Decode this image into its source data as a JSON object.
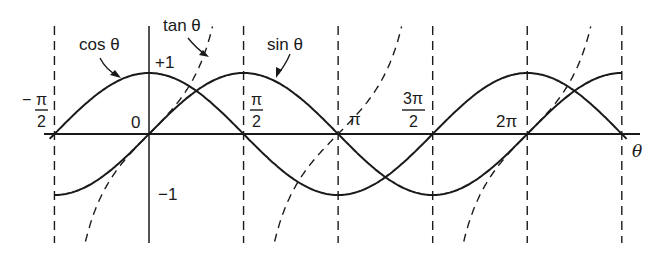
{
  "chart_data": {
    "type": "line",
    "title": "",
    "xlabel": "θ",
    "ylabel": "",
    "xlim": [
      -1.5708,
      7.854
    ],
    "ylim": [
      -1.6,
      1.6
    ],
    "grid": false,
    "legend": "inline annotations with arrows",
    "x_tick_labels": [
      "-π/2",
      "0",
      "π/2",
      "π",
      "3π/2",
      "2π"
    ],
    "y_tick_labels": [
      "+1",
      "-1"
    ],
    "vertical_dashed_asymptotes": [
      "-π/2",
      "π/2",
      "3π/2",
      "5π/2"
    ],
    "vertical_dashed_guides": [
      "π/2",
      "π",
      "3π/2",
      "2π",
      "5π/2"
    ],
    "series": [
      {
        "name": "cos θ",
        "style": "solid",
        "domain": [
          "-π/2",
          "5π/2"
        ],
        "x": [
          "-π/2",
          "0",
          "π/2",
          "π",
          "3π/2",
          "2π",
          "5π/2"
        ],
        "values": [
          0,
          1,
          0,
          -1,
          0,
          1,
          0
        ]
      },
      {
        "name": "sin θ",
        "style": "solid",
        "domain": [
          "-π/2",
          "5π/2"
        ],
        "x": [
          "-π/2",
          "0",
          "π/2",
          "π",
          "3π/2",
          "2π",
          "5π/2"
        ],
        "values": [
          -1,
          0,
          1,
          0,
          -1,
          0,
          1
        ]
      },
      {
        "name": "tan θ",
        "style": "dashed",
        "branches": [
          [
            "-π/2",
            "π/2"
          ],
          [
            "π/2",
            "3π/2"
          ],
          [
            "3π/2",
            "5π/2"
          ]
        ],
        "x": [
          "-π/4",
          "0",
          "π/4"
        ],
        "values": [
          -1,
          0,
          1
        ]
      }
    ],
    "annotations": [
      "cos θ",
      "tan θ",
      "sin θ",
      "+1",
      "-1"
    ]
  },
  "labels": {
    "cos": "cos θ",
    "tan": "tan θ",
    "sin": "sin θ",
    "plus_one": "+1",
    "minus_one": "−1",
    "zero": "0",
    "pi": "π",
    "two_pi": "2π",
    "neg_sign": "−",
    "pi_sym": "π",
    "three_pi": "3π",
    "two": "2",
    "theta": "θ"
  }
}
